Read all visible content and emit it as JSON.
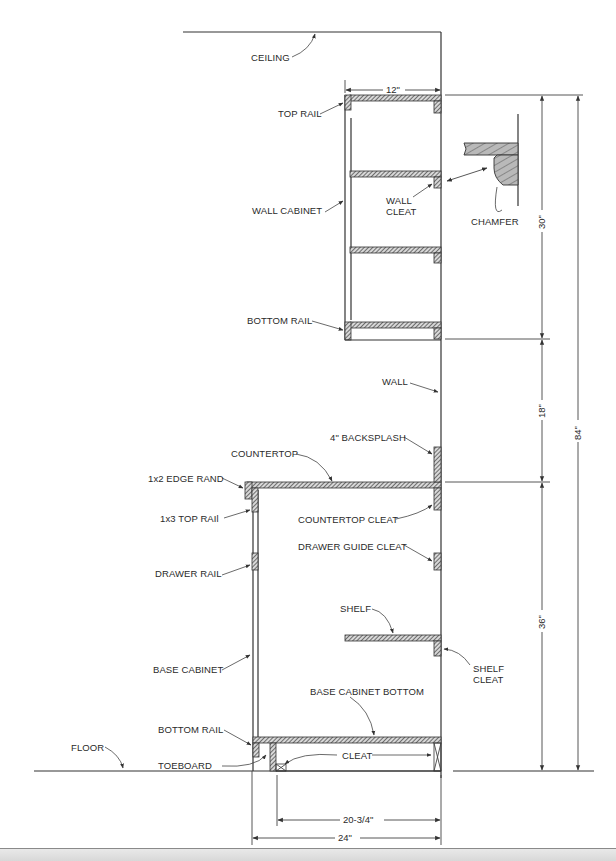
{
  "drawing": {
    "title": "Kitchen cabinet section elevation",
    "labels": {
      "ceiling": "CEILING",
      "top_rail": "TOP RAIL",
      "wall_cabinet": "WALL CABINET",
      "wall_cleat_1": "WALL",
      "wall_cleat_2": "CLEAT",
      "chamfer": "CHAMFER",
      "bottom_rail_upper": "BOTTOM RAIL",
      "wall": "WALL",
      "backsplash": "4\" BACKSPLASH",
      "countertop": "COUNTERTOP",
      "edge_band": "1x2 EDGE RAND",
      "top_rail_base": "1x3 TOP RAIl",
      "countertop_cleat": "COUNTERTOP CLEAT",
      "drawer_guide_cleat": "DRAWER GUIDE CLEAT",
      "drawer_rail": "DRAWER RAIL",
      "shelf": "SHELF",
      "shelf_cleat_1": "SHELF",
      "shelf_cleat_2": "CLEAT",
      "base_cabinet": "BASE CABINET",
      "base_cabinet_bottom": "BASE CABINET BOTTOM",
      "bottom_rail_lower": "BOTTOM RAIL",
      "toeboard": "TOEBOARD",
      "cleat": "CLEAT",
      "floor": "FLOOR"
    },
    "dimensions": {
      "wall_cabinet_depth": "12\"",
      "wall_cabinet_height": "30\"",
      "gap_height": "18\"",
      "base_height": "36\"",
      "total_height": "84\"",
      "cleat_span": "20-3/4\"",
      "base_depth": "24\""
    }
  }
}
